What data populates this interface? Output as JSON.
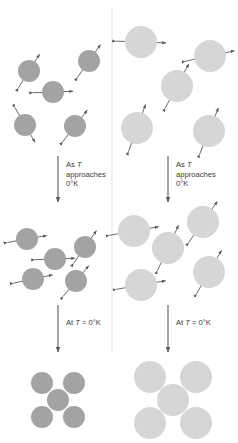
{
  "figure": {
    "background": "#ffffff",
    "divider_color": "#e2e2e2",
    "arrow_color": "#5a5a5a",
    "text_color": "#3a3a3a"
  },
  "panels": [
    {
      "id": "left",
      "particle_color": "#a3a3a3",
      "particle_radius": 11,
      "stages": [
        {
          "id": "left-stage-disordered",
          "caption": "random thermal motion",
          "particles": [
            {
              "cx": 29,
              "cy": 71,
              "angle": 32
            },
            {
              "cx": 53,
              "cy": 92,
              "angle": 88
            },
            {
              "cx": 89,
              "cy": 61,
              "angle": 35
            },
            {
              "cx": 25,
              "cy": 125,
              "angle": 150
            },
            {
              "cx": 75,
              "cy": 126,
              "angle": 38
            }
          ]
        },
        {
          "id": "left-stage-ordering",
          "caption": "partial alignment",
          "particles": [
            {
              "cx": 27,
              "cy": 239,
              "angle": 80
            },
            {
              "cx": 55,
              "cy": 259,
              "angle": 88
            },
            {
              "cx": 85,
              "cy": 247,
              "angle": 35
            },
            {
              "cx": 33,
              "cy": 279,
              "angle": 78
            },
            {
              "cx": 76,
              "cy": 281,
              "angle": 40
            }
          ]
        },
        {
          "id": "left-stage-lattice",
          "caption": "ordered lattice at absolute zero",
          "particles": [
            {
              "cx": 42,
              "cy": 383,
              "angle": null
            },
            {
              "cx": 74,
              "cy": 383,
              "angle": null
            },
            {
              "cx": 58,
              "cy": 400,
              "angle": null
            },
            {
              "cx": 42,
              "cy": 417,
              "angle": null
            },
            {
              "cx": 74,
              "cy": 417,
              "angle": null
            }
          ]
        }
      ],
      "transitions": [
        {
          "id": "left-transition-approaching",
          "arrow": {
            "x": 58,
            "y1": 156,
            "y2": 202
          },
          "lines": [
            "As T",
            "approaches",
            "0°K"
          ],
          "text_x": 66,
          "text_y": 167
        },
        {
          "id": "left-transition-atzero",
          "arrow": {
            "x": 58,
            "y1": 305,
            "y2": 352
          },
          "lines": [
            "At T = 0°K"
          ],
          "text_x": 66,
          "text_y": 325
        }
      ]
    },
    {
      "id": "right",
      "particle_color": "#d6d6d6",
      "particle_radius": 16,
      "stages": [
        {
          "id": "right-stage-disordered",
          "caption": "random thermal motion",
          "particles": [
            {
              "cx": 141,
              "cy": 42,
              "angle": 92
            },
            {
              "cx": 210,
              "cy": 56,
              "angle": 78
            },
            {
              "cx": 177,
              "cy": 86,
              "angle": 28
            },
            {
              "cx": 137,
              "cy": 128,
              "angle": 20
            },
            {
              "cx": 209,
              "cy": 131,
              "angle": 22
            }
          ]
        },
        {
          "id": "right-stage-ordering",
          "caption": "partial alignment",
          "particles": [
            {
              "cx": 134,
              "cy": 231,
              "angle": 80
            },
            {
              "cx": 203,
              "cy": 222,
              "angle": 35
            },
            {
              "cx": 168,
              "cy": 248,
              "angle": 25
            },
            {
              "cx": 141,
              "cy": 285,
              "angle": 80
            },
            {
              "cx": 209,
              "cy": 272,
              "angle": 30
            }
          ]
        },
        {
          "id": "right-stage-lattice",
          "caption": "ordered lattice at absolute zero",
          "particles": [
            {
              "cx": 150,
              "cy": 377,
              "angle": null
            },
            {
              "cx": 196,
              "cy": 377,
              "angle": null
            },
            {
              "cx": 173,
              "cy": 400,
              "angle": null
            },
            {
              "cx": 150,
              "cy": 423,
              "angle": null
            },
            {
              "cx": 196,
              "cy": 423,
              "angle": null
            }
          ]
        }
      ],
      "transitions": [
        {
          "id": "right-transition-approaching",
          "arrow": {
            "x": 168,
            "y1": 156,
            "y2": 202
          },
          "lines": [
            "As T",
            "approaches",
            "0°K"
          ],
          "text_x": 176,
          "text_y": 167
        },
        {
          "id": "right-transition-atzero",
          "arrow": {
            "x": 168,
            "y1": 305,
            "y2": 352
          },
          "lines": [
            "At T = 0°K"
          ],
          "text_x": 176,
          "text_y": 325
        }
      ]
    }
  ],
  "divider": {
    "x": 112,
    "y1": 8,
    "y2": 352
  }
}
